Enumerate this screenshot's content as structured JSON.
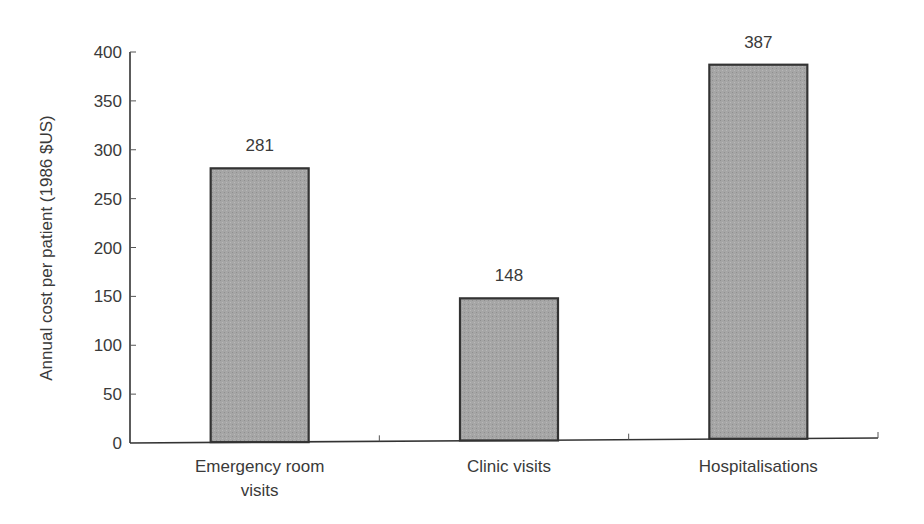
{
  "chart_data": {
    "type": "bar",
    "title": "",
    "xlabel": "",
    "ylabel": "Annual  cost per patient (1986 $US)",
    "categories": [
      "Emergency room visits",
      "Clinic visits",
      "Hospitalisations"
    ],
    "category_lines": [
      [
        "Emergency room",
        "visits"
      ],
      [
        "Clinic visits"
      ],
      [
        "Hospitalisations"
      ]
    ],
    "values": [
      281,
      148,
      387
    ],
    "value_labels": [
      "281",
      "148",
      "387"
    ],
    "ylim": [
      0,
      400
    ],
    "yticks": [
      0,
      50,
      100,
      150,
      200,
      250,
      300,
      350,
      400
    ],
    "grid": false,
    "legend": null,
    "bar_color": "#a8a8a8",
    "bar_edge_color": "#333333"
  }
}
